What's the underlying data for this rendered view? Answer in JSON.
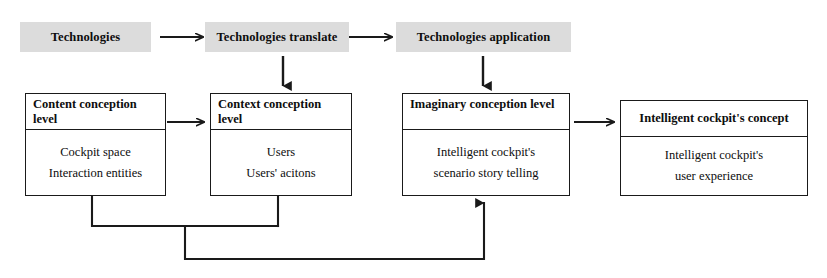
{
  "diagram": {
    "colors": {
      "stage_label_background": "#dcdcdc",
      "box_border": "#1a1a1a",
      "box_background": "#ffffff",
      "text": "#0d0d0d",
      "connector": "#1a1a1a",
      "page_background": "#ffffff"
    }
  },
  "stages": [
    {
      "id": "technologies",
      "label": "Technologies"
    },
    {
      "id": "technologies-translate",
      "label": "Technologies translate"
    },
    {
      "id": "technologies-application",
      "label": "Technologies application"
    }
  ],
  "boxes": [
    {
      "id": "content-conception-level",
      "header": "Content conception level",
      "body": [
        "Cockpit space",
        "Interaction entities"
      ]
    },
    {
      "id": "context-conception-level",
      "header": "Context conception level",
      "body": [
        "Users",
        "Users' acitons"
      ]
    },
    {
      "id": "imaginary-conception-level",
      "header": "Imaginary  conception level",
      "body": [
        "Intelligent cockpit's",
        "scenario story telling"
      ]
    },
    {
      "id": "intelligent-cockpit-concept",
      "header": "Intelligent cockpit's  concept",
      "body": [
        "Intelligent cockpit's",
        "user experience"
      ]
    }
  ],
  "arrows": [
    {
      "id": "stage1-to-stage2",
      "direction": "right",
      "from": "technologies",
      "to": "technologies-translate"
    },
    {
      "id": "stage2-to-stage3",
      "direction": "right",
      "from": "technologies-translate",
      "to": "technologies-application"
    },
    {
      "id": "stage2-to-box2",
      "direction": "down",
      "from": "technologies-translate",
      "to": "context-conception-level"
    },
    {
      "id": "stage3-to-box3",
      "direction": "down",
      "from": "technologies-application",
      "to": "imaginary-conception-level"
    },
    {
      "id": "box1-to-box2",
      "direction": "right",
      "from": "content-conception-level",
      "to": "context-conception-level"
    },
    {
      "id": "box3-to-box4",
      "direction": "right",
      "from": "imaginary-conception-level",
      "to": "intelligent-cockpit-concept"
    },
    {
      "id": "box1-box2-merge-to-box3",
      "direction": "up",
      "from": "content-conception-level and context-conception-level",
      "to": "imaginary-conception-level"
    }
  ]
}
